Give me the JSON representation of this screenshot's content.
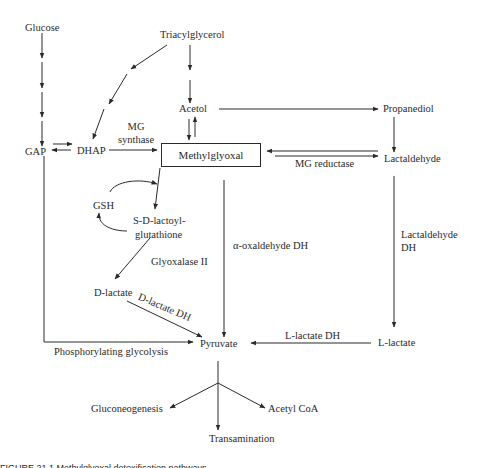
{
  "diagram": {
    "nodes": {
      "glucose": "Glucose",
      "triacylglycerol": "Triacylglycerol",
      "acetol": "Acetol",
      "propanediol": "Propanediol",
      "gap": "GAP",
      "dhap": "DHAP",
      "methylglyoxal": "Methylglyoxal",
      "lactaldehyde": "Lactaldehyde",
      "gsh": "GSH",
      "s_d_lactoyl_1": "S-D-lactoyl-",
      "s_d_lactoyl_2": "glutathione",
      "d_lactate": "D-lactate",
      "pyruvate": "Pyruvate",
      "l_lactate": "L-lactate",
      "gluconeogenesis": "Gluconeogenesis",
      "acetyl_coa": "Acetyl CoA",
      "transamination": "Transamination"
    },
    "enzymes": {
      "mg_synthase_1": "MG",
      "mg_synthase_2": "synthase",
      "mg_reductase": "MG reductase",
      "glyoxalase_ii": "Glyoxalase II",
      "d_lactate_dh": "D-lactate DH",
      "alpha_oxaldehyde_dh": "α-oxaldehyde DH",
      "lactaldehyde_dh_1": "Lactaldehyde",
      "lactaldehyde_dh_2": "DH",
      "l_lactate_dh": "L-lactate DH",
      "phosphorylating_glycolysis": "Phosphorylating glycolysis"
    },
    "caption": "FIGURE 21.1  Methylglyoxal detoxification pathways."
  }
}
